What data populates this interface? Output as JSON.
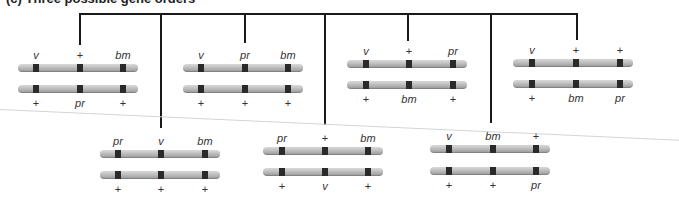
{
  "diagram": {
    "title_clipped": "(c) Three possible gene orders",
    "colors": {
      "chromosome": "#b8b8b8",
      "band": "#2a2a2a",
      "connector": "#1a1a1a"
    },
    "top_row": [
      {
        "top": [
          "v",
          "+",
          "bm"
        ],
        "bottom": [
          "+",
          "pr",
          "+"
        ]
      },
      {
        "top": [
          "v",
          "pr",
          "bm"
        ],
        "bottom": [
          "+",
          "+",
          "+"
        ]
      },
      {
        "top": [
          "v",
          "+",
          "pr"
        ],
        "bottom": [
          "+",
          "bm",
          "+"
        ]
      },
      {
        "top": [
          "v",
          "+",
          "+"
        ],
        "bottom": [
          "+",
          "bm",
          "pr"
        ]
      }
    ],
    "bottom_row": [
      {
        "top": [
          "pr",
          "v",
          "bm"
        ],
        "bottom": [
          "+",
          "+",
          "+"
        ]
      },
      {
        "top": [
          "pr",
          "+",
          "bm"
        ],
        "bottom": [
          "+",
          "v",
          "+"
        ]
      },
      {
        "top": [
          "v",
          "bm",
          "+"
        ],
        "bottom": [
          "+",
          "+",
          "pr"
        ]
      }
    ]
  }
}
